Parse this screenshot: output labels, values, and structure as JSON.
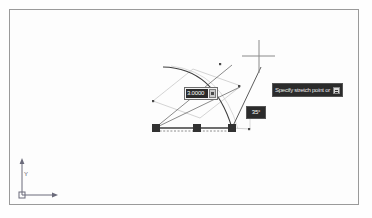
{
  "app": {
    "name": "cad-drawing-canvas",
    "background_color": "#fdfdfd",
    "frame_color": "#9a9a9a"
  },
  "dynamic_input": {
    "distance_field": {
      "value": "3.0000",
      "locked_icon": "lock-icon"
    },
    "angle_field": {
      "value": "35°"
    }
  },
  "command_prompt": {
    "text": "Specify stretch point or",
    "options_icon": "options-menu-icon"
  },
  "ucs_icon": {
    "y_label": "Y",
    "x_label": "X",
    "origin_marker": "ucs-origin-box"
  },
  "geometry": {
    "grips": [
      {
        "name": "grip-left",
        "x": 154,
        "y": 127
      },
      {
        "name": "grip-mid",
        "x": 196,
        "y": 127
      },
      {
        "name": "grip-right",
        "x": 231,
        "y": 127
      }
    ],
    "snap_points": [
      {
        "name": "snap-upper-right",
        "x": 221,
        "y": 62
      },
      {
        "name": "snap-mid-right",
        "x": 238,
        "y": 85
      },
      {
        "name": "snap-left",
        "x": 152,
        "y": 100
      },
      {
        "name": "snap-lower-right",
        "x": 248,
        "y": 128
      }
    ],
    "crosshair": {
      "x": 258,
      "y": 63
    },
    "colors": {
      "grip_fill": "#3a3a3a",
      "line": "#555555",
      "arc": "#3a3a3a",
      "dashed": "#7a7a7a",
      "ghost": "#b9b9b9"
    }
  }
}
